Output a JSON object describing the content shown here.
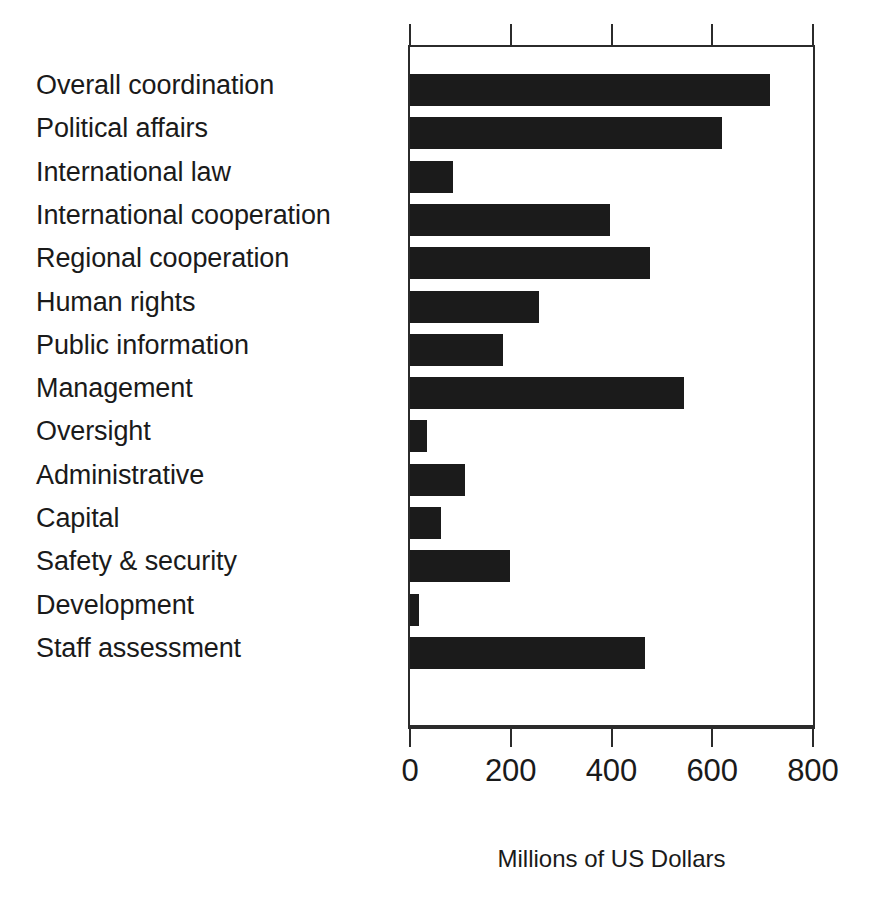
{
  "chart_data": {
    "type": "bar",
    "orientation": "horizontal",
    "title": "",
    "xlabel": "Millions of US Dollars",
    "ylabel": "",
    "xlim": [
      0,
      800
    ],
    "xticks": [
      0,
      200,
      400,
      600,
      800
    ],
    "xtick_labels": [
      "0",
      "200",
      "400",
      "600",
      "800"
    ],
    "grid": false,
    "legend": null,
    "bar_color": "#1b1b1b",
    "axis_color": "#2b2b2b",
    "background": "#ffffff",
    "categories": [
      "Overall coordination",
      "Political affairs",
      "International law",
      "International cooperation",
      "Regional cooperation",
      "Human rights",
      "Public information",
      "Management",
      "Oversight",
      "Administrative",
      "Capital",
      "Safety & security",
      "Development",
      "Staff assessment"
    ],
    "values": [
      715,
      620,
      86,
      398,
      477,
      256,
      184,
      543,
      34,
      109,
      62,
      199,
      17,
      467
    ]
  }
}
